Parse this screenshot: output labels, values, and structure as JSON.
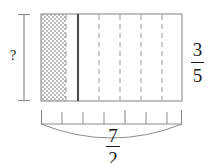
{
  "figure": {
    "kind": "area-model-fraction-diagram",
    "canvas": {
      "width": 213,
      "height": 163,
      "background": "#ffffff"
    },
    "colors": {
      "outline": "#8c8c8c",
      "thick_divider": "#4a4a4a",
      "dashed": "#9a9a9a",
      "shading_light": "#ffffff",
      "shading_dark": "#b5b5b5",
      "text": "#1a1a1a",
      "measure_line": "#8c8c8c"
    },
    "rectangle": {
      "x": 41,
      "y": 14,
      "width": 141,
      "height": 87,
      "label": "area-model-rectangle"
    },
    "shaded_region": {
      "x": 41,
      "y": 14,
      "width": 25,
      "height": 87,
      "pattern": "fine-checkerboard-stipple",
      "label": "shaded-product-region"
    },
    "thick_divider": {
      "x": 78,
      "label": "unit-boundary-line"
    },
    "dashed_lines_x": [
      66,
      99,
      120,
      141,
      162
    ],
    "vertical_measure": {
      "x": 24,
      "y_top": 14,
      "y_bottom": 101,
      "cap_half_width": 6,
      "label": "unknown-height-measure"
    },
    "bottom_ruler": {
      "y_baseline": 124,
      "x_start": 41,
      "x_end": 182,
      "tick_height": 14,
      "ticks_x": [
        41,
        62,
        83,
        104,
        125,
        146,
        167,
        182
      ],
      "label": "width-tick-ruler"
    },
    "brace_arc": {
      "x_start": 41,
      "x_end": 182,
      "y_start": 124,
      "y_dip": 140,
      "label": "width-span-brace"
    }
  },
  "labels": {
    "unknown_height": "?",
    "height_fraction": {
      "numerator": "3",
      "denominator": "5"
    },
    "width_fraction": {
      "numerator": "7",
      "denominator": "2"
    }
  }
}
